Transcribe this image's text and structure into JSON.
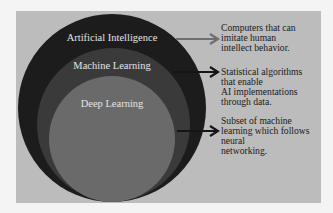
{
  "diagram": {
    "type": "nested-circles",
    "colors": {
      "page_background": "#f4f4f4",
      "panel_background": "#bcbcbc",
      "outer_circle": "#1c1c1c",
      "middle_circle": "#3a3a3a",
      "inner_circle": "#6a6a6a",
      "circle_label_text": "#e4e4e4",
      "description_text": "#1a1a1a",
      "ai_arrow": "#6e6e6e",
      "ml_arrow": "#151515",
      "dl_arrow": "#151515"
    },
    "circles": [
      {
        "label": "Artificial Intelligence",
        "description_lines": [
          "Computers that can",
          "imitate human",
          "intellect behavior."
        ]
      },
      {
        "label": "Machine Learning",
        "description_lines": [
          "Statistical algorithms",
          "that enable",
          "AI implementations",
          "through data."
        ]
      },
      {
        "label": "Deep Learning",
        "description_lines": [
          "Subset of machine",
          "learning which follows",
          "neural",
          "networking."
        ]
      }
    ]
  }
}
